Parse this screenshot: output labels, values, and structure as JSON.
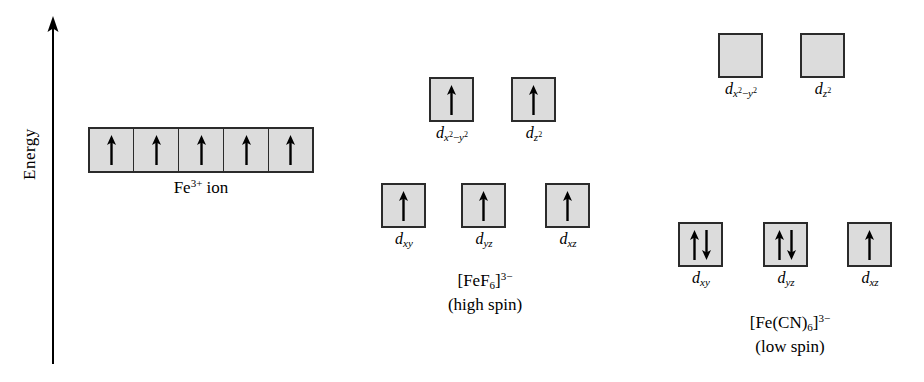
{
  "figure": {
    "background_color": "#ffffff",
    "box_fill_color": "#dcdcdc",
    "box_border_color": "#2b2b2b",
    "ink_color": "#000000"
  },
  "axis": {
    "label": "Energy",
    "direction": "up",
    "icon": "up-arrow-icon"
  },
  "panels": [
    {
      "id": "free-ion",
      "caption_primary": "Fe",
      "caption_sup": "3+",
      "caption_suffix": " ion",
      "levels": [
        {
          "id": "degenerate-d",
          "orbitals": [
            {
              "label_main": "d",
              "sub": "",
              "electrons": [
                "up"
              ]
            },
            {
              "label_main": "d",
              "sub": "",
              "electrons": [
                "up"
              ]
            },
            {
              "label_main": "d",
              "sub": "",
              "electrons": [
                "up"
              ]
            },
            {
              "label_main": "d",
              "sub": "",
              "electrons": [
                "up"
              ]
            },
            {
              "label_main": "d",
              "sub": "",
              "electrons": [
                "up"
              ]
            }
          ]
        }
      ]
    },
    {
      "id": "fef6",
      "caption_line1": "[FeF6]3-",
      "caption_line2": "(high spin)",
      "levels": [
        {
          "id": "eg",
          "orbitals": [
            {
              "label": "dx2-y2",
              "electrons": [
                "up"
              ]
            },
            {
              "label": "dz2",
              "electrons": [
                "up"
              ]
            }
          ]
        },
        {
          "id": "t2g",
          "orbitals": [
            {
              "label": "dxy",
              "electrons": [
                "up"
              ]
            },
            {
              "label": "dyz",
              "electrons": [
                "up"
              ]
            },
            {
              "label": "dxz",
              "electrons": [
                "up"
              ]
            }
          ]
        }
      ]
    },
    {
      "id": "fecn6",
      "caption_line1": "[Fe(CN)6]3-",
      "caption_line2": "(low spin)",
      "levels": [
        {
          "id": "eg",
          "orbitals": [
            {
              "label": "dx2-y2",
              "electrons": []
            },
            {
              "label": "dz2",
              "electrons": []
            }
          ]
        },
        {
          "id": "t2g",
          "orbitals": [
            {
              "label": "dxy",
              "electrons": [
                "up",
                "down"
              ]
            },
            {
              "label": "dyz",
              "electrons": [
                "up",
                "down"
              ]
            },
            {
              "label": "dxz",
              "electrons": [
                "up"
              ]
            }
          ]
        }
      ]
    }
  ],
  "text": {
    "energy": "Energy",
    "fe_ion_main": "Fe",
    "fe_ion_sup": "3+",
    "fe_ion_tail": " ion",
    "fef6_bracket_open": "[FeF",
    "fef6_sub": "6",
    "fef6_bracket_close": "]",
    "fef6_charge": "3−",
    "fef6_spin": "(high spin)",
    "fecn6_bracket_open": "[Fe(CN)",
    "fecn6_sub": "6",
    "fecn6_bracket_close": "]",
    "fecn6_charge": "3−",
    "fecn6_spin": "(low spin)",
    "d": "d",
    "sub_x": "x",
    "sub_y": "y",
    "sub_z": "z",
    "sup_two": "2",
    "minus": "−",
    "sub_xy": "xy",
    "sub_yz": "yz",
    "sub_xz": "xz"
  }
}
